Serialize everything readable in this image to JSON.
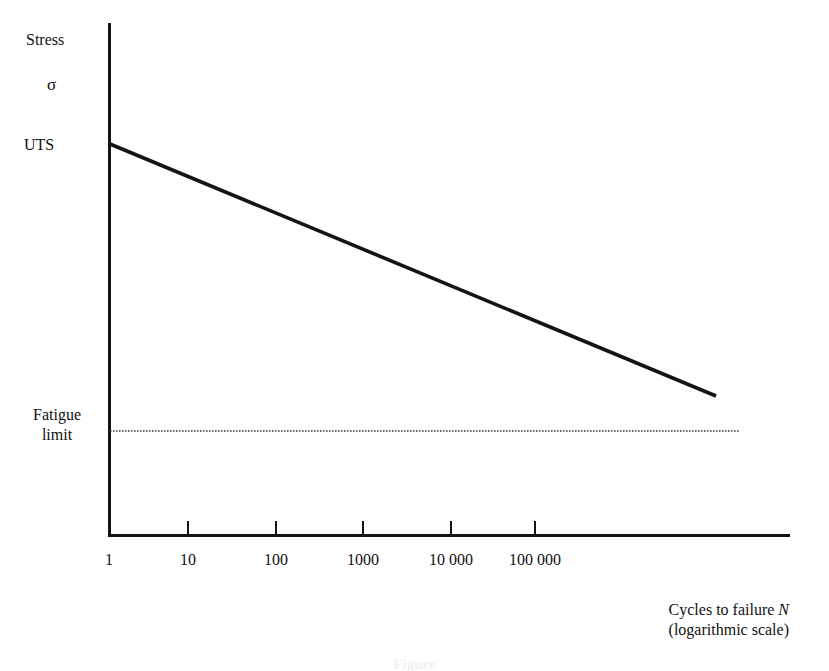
{
  "figure": {
    "background_color": "#ffffff",
    "ink_color": "#141414",
    "caption": "Figure"
  },
  "axes": {
    "y_label_top": "Stress",
    "y_label_symbol": "σ",
    "y_label_uts": "UTS",
    "y_label_fatigue_line1": "Fatigue",
    "y_label_fatigue_line2": "limit",
    "x_caption_line1_text": "Cycles to failure ",
    "x_caption_line1_symbol": "N",
    "x_caption_line2": "(logarithmic scale)"
  },
  "chart_data": {
    "type": "line",
    "xlabel": "Cycles to failure N (logarithmic scale)",
    "ylabel": "Stress σ",
    "xscale": "log",
    "xlim": [
      1,
      1000000
    ],
    "grid": false,
    "legend": false,
    "xticks": [
      {
        "value": 1,
        "label": "1",
        "px": 109
      },
      {
        "value": 10,
        "label": "10",
        "px": 188
      },
      {
        "value": 100,
        "label": "100",
        "px": 276
      },
      {
        "value": 1000,
        "label": "1000",
        "px": 363
      },
      {
        "value": 10000,
        "label": "10 000",
        "px": 451
      },
      {
        "value": 100000,
        "label": "100 000",
        "px": 535
      }
    ],
    "yticks": [
      {
        "label": "UTS",
        "px": 144
      },
      {
        "label": "Fatigue limit",
        "px": 431
      }
    ],
    "series": [
      {
        "name": "S-N curve",
        "style": "solid",
        "width": 3.6,
        "color": "#141414",
        "points": [
          {
            "x": 1,
            "y_label": "UTS",
            "px": 110,
            "py": 144
          },
          {
            "x": 200000,
            "y_label": "",
            "px": 716,
            "py": 396
          }
        ]
      },
      {
        "name": "Fatigue limit",
        "style": "dotted",
        "width": 1.3,
        "color": "#3a3a4a",
        "points": [
          {
            "x": 1,
            "y_label": "Fatigue limit",
            "px": 110,
            "py": 431
          },
          {
            "x": 700000,
            "y_label": "Fatigue limit",
            "px": 740,
            "py": 431
          }
        ]
      }
    ],
    "annotations": [
      {
        "text": "Stress",
        "px": 26,
        "py": 40
      },
      {
        "text": "σ",
        "px": 47,
        "py": 85
      },
      {
        "text": "UTS",
        "px": 24,
        "py": 145
      },
      {
        "text": "Fatigue limit",
        "px": 21,
        "py": 415
      }
    ]
  }
}
